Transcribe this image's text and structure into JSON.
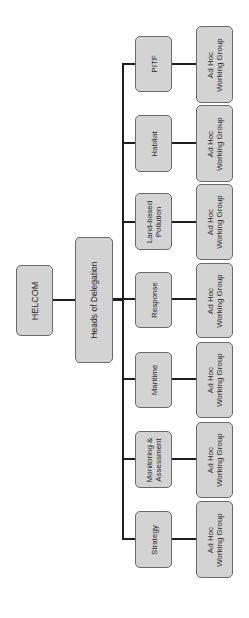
{
  "diagram": {
    "type": "org-chart",
    "orientation": "rotated-90-ccw",
    "colors": {
      "box_fill": "#d3d3d3",
      "box_border": "#6a6a6a",
      "line": "#1e1e1e",
      "text": "#2a2a2a"
    },
    "root": {
      "label": "HELCOM"
    },
    "level1": {
      "label": "Heads of Delegation"
    },
    "groups": [
      {
        "label": "PITF",
        "child": "Ad Hoc\nWorking Group"
      },
      {
        "label": "Habitat",
        "child": "Ad Hoc\nWorking Group"
      },
      {
        "label": "Land-based\nPollution",
        "child": "Ad Hoc\nWorking Group"
      },
      {
        "label": "Response",
        "child": "Ad Hoc\nWorking Group"
      },
      {
        "label": "Maritime",
        "child": "Ad Hoc\nWorking Group"
      },
      {
        "label": "Monitoring &\nAssessment",
        "child": "Ad Hoc\nWorking Group"
      },
      {
        "label": "Strategy",
        "child": "Ad Hoc\nWorking Group"
      }
    ]
  }
}
